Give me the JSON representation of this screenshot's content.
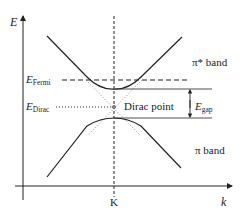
{
  "diagram": {
    "axes": {
      "y_label": "E",
      "x_label": "k",
      "x_tick": "K"
    },
    "bands": {
      "upper": "π* band",
      "lower": "π band"
    },
    "energy_levels": {
      "fermi": {
        "symbol": "E",
        "subscript": "Fermi"
      },
      "dirac": {
        "symbol": "E",
        "subscript": "Dirac"
      },
      "gap": {
        "symbol": "E",
        "subscript": "gap"
      }
    },
    "annotations": {
      "dirac_point": "Dirac point"
    },
    "colors": {
      "line": "#222222",
      "dotted": "#888888",
      "background": "#ffffff"
    }
  }
}
